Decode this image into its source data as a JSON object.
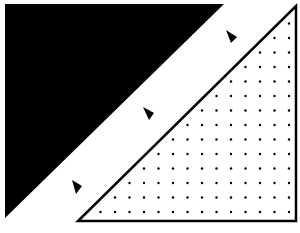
{
  "figure": {
    "background": "#ffffff",
    "black_triangle": {
      "fill": "#000000",
      "points": [
        [
          5,
          4
        ],
        [
          224,
          4
        ],
        [
          5,
          218
        ]
      ]
    },
    "dotted_triangle": {
      "fill": "#ffffff",
      "stroke": "#000000",
      "points": [
        [
          296,
          6
        ],
        [
          296,
          221
        ],
        [
          78,
          221
        ]
      ],
      "dot_color": "#000000",
      "dot_spacing": 14.5
    },
    "arrowheads": [
      {
        "name": "arrowhead-top",
        "x": 231,
        "y": 36
      },
      {
        "name": "arrowhead-middle",
        "x": 149,
        "y": 113
      },
      {
        "name": "arrowhead-bottom",
        "x": 77,
        "y": 187
      }
    ]
  }
}
